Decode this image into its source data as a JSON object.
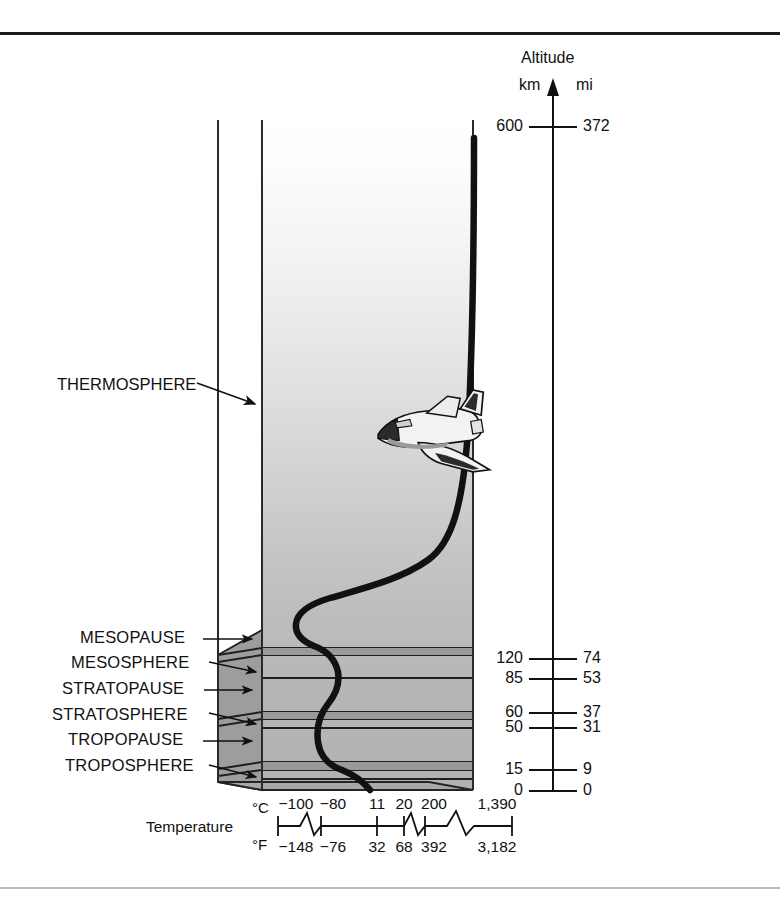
{
  "figure": {
    "title_hidden": "Layers of the Atmosphere",
    "layer_labels": [
      {
        "name": "MESOPAUSE",
        "x": 80,
        "y": 633
      },
      {
        "name": "MESOSPHERE",
        "x": 71,
        "y": 658
      },
      {
        "name": "STRATOPAUSE",
        "x": 62,
        "y": 684
      },
      {
        "name": "STRATOSPHERE",
        "x": 52,
        "y": 710
      },
      {
        "name": "TROPOPAUSE",
        "x": 68,
        "y": 735
      },
      {
        "name": "TROPOSPHERE",
        "x": 65,
        "y": 761
      }
    ],
    "thermosphere_label": {
      "name": "THERMOSPHERE",
      "x": 57,
      "y": 383
    },
    "vehicle": {
      "name": "space-shuttle",
      "x": 372,
      "y": 392
    }
  },
  "altitude_axis": {
    "title": "Altitude",
    "unit_left": "km",
    "unit_right": "mi",
    "ticks": [
      {
        "km": "600",
        "mi": "372",
        "y": 127
      },
      {
        "km": "120",
        "mi": "74",
        "y": 659
      },
      {
        "km": "85",
        "mi": "53",
        "y": 679
      },
      {
        "km": "60",
        "mi": "37",
        "y": 713
      },
      {
        "km": "50",
        "mi": "31",
        "y": 728
      },
      {
        "km": "15",
        "mi": "9",
        "y": 770
      },
      {
        "km": "0",
        "mi": "0",
        "y": 791
      }
    ]
  },
  "temperature_axis": {
    "label": "Temperature",
    "unit_c": "°C",
    "unit_f": "°F",
    "celsius_ticks": [
      "−100",
      "−80",
      "11",
      "20",
      "200",
      "1,390"
    ],
    "fahrenheit_ticks": [
      "−148",
      "−76",
      "32",
      "68",
      "392",
      "3,182"
    ],
    "tick_x": [
      296,
      333,
      377,
      404,
      434,
      497
    ]
  },
  "chart_data": {
    "type": "line",
    "xlabel": "Temperature",
    "ylabel": "Altitude",
    "y_units": [
      "km",
      "mi"
    ],
    "ylim": [
      0,
      600
    ],
    "grid": false,
    "legend": "none",
    "x_tick_labels_c": [
      "-100",
      "-80",
      "11",
      "20",
      "200",
      "1390"
    ],
    "x_tick_labels_f": [
      "-148",
      "-76",
      "32",
      "68",
      "392",
      "3182"
    ],
    "y_tick_labels_km": [
      "0",
      "15",
      "50",
      "60",
      "85",
      "120",
      "600"
    ],
    "y_tick_labels_mi": [
      "0",
      "9",
      "31",
      "37",
      "53",
      "74",
      "372"
    ],
    "layers": [
      {
        "name": "TROPOSPHERE",
        "from_km": 0,
        "to_km": 15
      },
      {
        "name": "TROPOPAUSE",
        "from_km": 15,
        "to_km": 20
      },
      {
        "name": "STRATOSPHERE",
        "from_km": 20,
        "to_km": 50
      },
      {
        "name": "STRATOPAUSE",
        "from_km": 50,
        "to_km": 60
      },
      {
        "name": "MESOSPHERE",
        "from_km": 60,
        "to_km": 85
      },
      {
        "name": "MESOPAUSE",
        "from_km": 85,
        "to_km": 120
      },
      {
        "name": "THERMOSPHERE",
        "from_km": 120,
        "to_km": 600
      }
    ],
    "series": [
      {
        "name": "Temperature",
        "points": [
          {
            "altitude_km": 0,
            "temp_c": 20
          },
          {
            "altitude_km": 15,
            "temp_c": -80
          },
          {
            "altitude_km": 20,
            "temp_c": -80
          },
          {
            "altitude_km": 50,
            "temp_c": 11
          },
          {
            "altitude_km": 60,
            "temp_c": 11
          },
          {
            "altitude_km": 85,
            "temp_c": -100
          },
          {
            "altitude_km": 120,
            "temp_c": 200
          },
          {
            "altitude_km": 300,
            "temp_c": 1200
          },
          {
            "altitude_km": 600,
            "temp_c": 1390
          }
        ]
      }
    ]
  }
}
